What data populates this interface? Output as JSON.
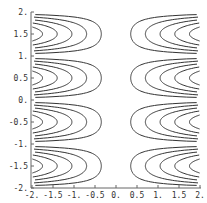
{
  "chart_data": {
    "type": "contour",
    "title": "",
    "function_hint": "x*sin(pi*y)",
    "xlabel": "",
    "ylabel": "",
    "xlim": [
      -2,
      2
    ],
    "ylim": [
      -2,
      2
    ],
    "x_ticks": [
      "-2.",
      "-1.5",
      "-1.",
      "-0.5",
      "0.",
      "0.5",
      "1.",
      "1.5",
      "2."
    ],
    "x_tick_values": [
      -2,
      -1.5,
      -1,
      -0.5,
      0,
      0.5,
      1,
      1.5,
      2
    ],
    "y_ticks": [
      "2.",
      "1.5",
      "1.",
      "0.5",
      "0.",
      "-0.5",
      "-1.",
      "-1.5",
      "-2."
    ],
    "y_tick_values": [
      2,
      1.5,
      1,
      0.5,
      0,
      -0.5,
      -1,
      -1.5,
      -2
    ],
    "contour_levels": [
      0.35,
      0.7,
      1.05,
      1.4,
      1.75
    ],
    "line_color": "#333333",
    "grid": false,
    "legend": null
  }
}
